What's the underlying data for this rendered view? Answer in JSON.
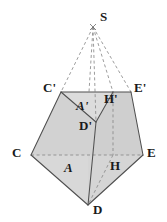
{
  "figure": {
    "type": "geometry-diagram",
    "width": 167,
    "height": 222,
    "background_color": "#ffffff",
    "face_fill_color": "#d4d4d4",
    "face_fill_color_light": "#dcdcdc",
    "face_fill_color_dark": "#c9c9c9",
    "stroke_color": "#4a4a4a",
    "dashed_stroke_color": "#7a7a7a",
    "label_color": "#1a1a1a"
  },
  "vertices": [
    {
      "id": "S",
      "label": "S",
      "x": 93,
      "y": 26,
      "label_x": 100,
      "label_y": 10,
      "italic": false
    },
    {
      "id": "Cp",
      "label": "C'",
      "x": 61,
      "y": 92,
      "label_x": 43,
      "label_y": 81,
      "italic": false
    },
    {
      "id": "Ep",
      "label": "E'",
      "x": 131,
      "y": 92,
      "label_x": 134,
      "label_y": 81,
      "italic": false
    },
    {
      "id": "Hp",
      "label": "H'",
      "x": 113,
      "y": 92,
      "label_x": 104,
      "label_y": 92,
      "italic": false
    },
    {
      "id": "Ap",
      "label": "A'",
      "x": 84,
      "y": 104,
      "label_x": 76,
      "label_y": 99,
      "italic": true
    },
    {
      "id": "Dp",
      "label": "D'",
      "x": 96,
      "y": 122,
      "label_x": 79,
      "label_y": 119,
      "italic": false
    },
    {
      "id": "C",
      "label": "C",
      "x": 31,
      "y": 155,
      "label_x": 12,
      "label_y": 146,
      "italic": false
    },
    {
      "id": "E",
      "label": "E",
      "x": 143,
      "y": 155,
      "label_x": 147,
      "label_y": 146,
      "italic": false
    },
    {
      "id": "H",
      "label": "H",
      "x": 113,
      "y": 155,
      "label_x": 110,
      "label_y": 159,
      "italic": false
    },
    {
      "id": "A",
      "label": "A",
      "x": 70,
      "y": 170,
      "label_x": 64,
      "label_y": 161,
      "italic": true
    },
    {
      "id": "D",
      "label": "D",
      "x": 88,
      "y": 205,
      "label_x": 93,
      "label_y": 203,
      "italic": false
    }
  ],
  "edges": {
    "solid": [
      {
        "from": "Cp",
        "to": "Ep",
        "note": "top edge of cross-section"
      },
      {
        "from": "Cp",
        "to": "C",
        "note": "left lateral edge"
      },
      {
        "from": "Ep",
        "to": "E",
        "note": "right lateral edge"
      },
      {
        "from": "C",
        "to": "D",
        "note": "lower-left base edge"
      },
      {
        "from": "E",
        "to": "D",
        "note": "lower-right base edge"
      },
      {
        "from": "Cp",
        "to": "Dp",
        "note": "inner fold left"
      },
      {
        "from": "Hp",
        "to": "Dp",
        "note": "inner fold right"
      },
      {
        "from": "Dp",
        "to": "D",
        "note": "vertical inner fold"
      }
    ],
    "dashed": [
      {
        "from": "S",
        "to": "Cp",
        "note": "apex to C'"
      },
      {
        "from": "S",
        "to": "Ep",
        "note": "apex to E'"
      },
      {
        "from": "S",
        "to": "Hp",
        "note": "apex to H'"
      },
      {
        "from": "S",
        "to": "Dp",
        "note": "apex to D'"
      },
      {
        "from": "C",
        "to": "E",
        "note": "base diagonal CE"
      },
      {
        "from": "Hp",
        "to": "H",
        "note": "vertical H' to H"
      },
      {
        "from": "H",
        "to": "D",
        "note": "H down to D"
      }
    ]
  }
}
